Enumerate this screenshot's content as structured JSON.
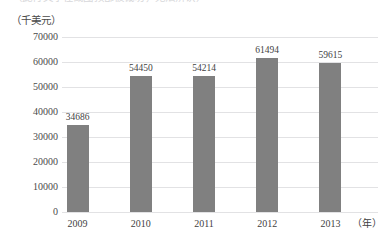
{
  "top_caption": {
    "text": "（此行文字在截图顶部被裁切，无法辨认）"
  },
  "axes": {
    "y_unit_label": "（千美元）",
    "x_unit_label": "（年）"
  },
  "chart_data": {
    "type": "bar",
    "title": "",
    "subtitle": "",
    "xlabel": "（年）",
    "ylabel": "（千美元）",
    "categories": [
      "2009",
      "2010",
      "2011",
      "2012",
      "2013"
    ],
    "values": [
      34686,
      54450,
      54214,
      61494,
      59615
    ],
    "value_labels": [
      "34686",
      "54450",
      "54214",
      "61494",
      "59615"
    ],
    "ylim": [
      0,
      70000
    ],
    "ytick_step": 10000,
    "yticks": [
      0,
      10000,
      20000,
      30000,
      40000,
      50000,
      60000,
      70000
    ],
    "ytick_labels": [
      "0",
      "10000",
      "20000",
      "30000",
      "40000",
      "50000",
      "60000",
      "70000"
    ],
    "grid": true,
    "grid_orientation": "horizontal",
    "legend": false,
    "legend_position": "none",
    "bar_color": "#808080",
    "gridline_color": "#e2e2e4",
    "background_color": "#ffffff",
    "text_color": "#3f3f3f"
  }
}
